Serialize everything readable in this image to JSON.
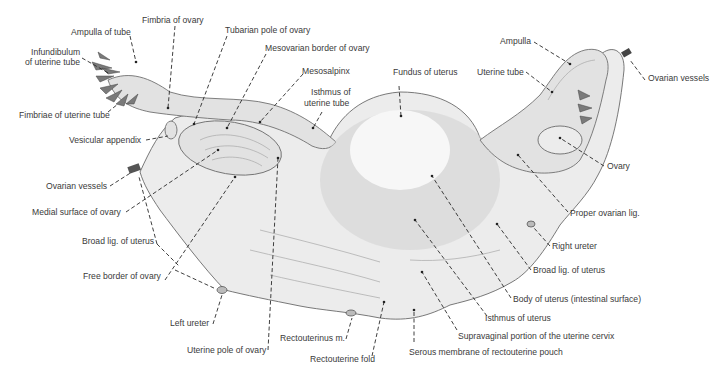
{
  "figure": {
    "labels": {
      "ampulla_of_tube": "Ampulla of tube",
      "infundibulum": "Infundibulum\nof uterine tube",
      "infundibulum_line1": "Infundibulum",
      "infundibulum_line2": "of uterine tube",
      "fimbriae_of_uterine_tube": "Fimbriae of uterine tube",
      "fimbria_of_ovary": "Fimbria of ovary",
      "tubarian_pole_of_ovary": "Tubarian pole of ovary",
      "mesovarian_border_of_ovary": "Mesovarian border of ovary",
      "mesosalpinx": "Mesosalpinx",
      "isthmus_of_uterine_tube_line1": "Isthmus of",
      "isthmus_of_uterine_tube_line2": "uterine tube",
      "fundus_of_uterus": "Fundus of uterus",
      "vesicular_appendix": "Vesicular appendix",
      "ovarian_vessels_left": "Ovarian vessels",
      "medial_surface_of_ovary": "Medial surface of ovary",
      "broad_lig_left": "Broad lig. of uterus",
      "free_border_of_ovary": "Free border of ovary",
      "left_ureter": "Left ureter",
      "uterine_pole_of_ovary": "Uterine pole of ovary",
      "rectouterinus_m": "Rectouterinus m.",
      "rectouterine_fold": "Rectouterine fold",
      "serous_membrane": "Serous membrane of rectouterine pouch",
      "supravaginal_portion": "Supravaginal portion of the uterine cervix",
      "isthmus_of_uterus": "Isthmus of uterus",
      "body_of_uterus": "Body of uterus (intestinal surface)",
      "broad_lig_right": "Broad lig. of uterus",
      "right_ureter": "Right ureter",
      "proper_ovarian_lig": "Proper ovarian lig.",
      "ovary": "Ovary",
      "ovarian_vessels_right": "Ovarian vessels",
      "uterine_tube": "Uterine tube",
      "ampulla": "Ampulla"
    }
  }
}
